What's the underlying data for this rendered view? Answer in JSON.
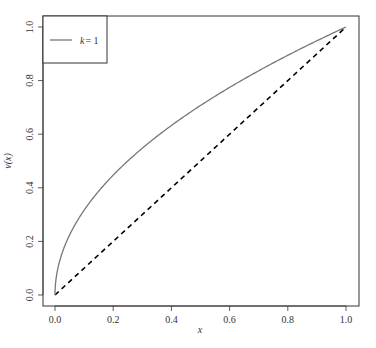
{
  "chart_data": {
    "type": "line",
    "title": "",
    "xlabel": "x",
    "ylabel": "v(x)",
    "xlim": [
      0,
      1
    ],
    "ylim": [
      0,
      1
    ],
    "grid": false,
    "x_ticks": [
      "0.0",
      "0.2",
      "0.4",
      "0.6",
      "0.8",
      "1.0"
    ],
    "y_ticks": [
      "0.0",
      "0.2",
      "0.4",
      "0.6",
      "0.8",
      "1.0"
    ],
    "legend": {
      "position": "top-left",
      "entries": [
        {
          "label_var": "k",
          "label_eq": "= 1",
          "style": "solid",
          "color": "#777777"
        }
      ]
    },
    "series": [
      {
        "name": "k = 1",
        "style": "solid",
        "color": "#777777",
        "x": [
          0,
          0.005,
          0.01,
          0.02,
          0.04,
          0.06,
          0.1,
          0.15,
          0.2,
          0.3,
          0.4,
          0.5,
          0.6,
          0.7,
          0.8,
          0.9,
          1.0
        ],
        "y": [
          0,
          0.071,
          0.1,
          0.141,
          0.2,
          0.245,
          0.316,
          0.387,
          0.447,
          0.548,
          0.632,
          0.707,
          0.775,
          0.837,
          0.894,
          0.949,
          1.0
        ]
      },
      {
        "name": "diagonal",
        "style": "dashed",
        "color": "#000000",
        "x": [
          0,
          1
        ],
        "y": [
          0,
          1
        ]
      }
    ]
  }
}
